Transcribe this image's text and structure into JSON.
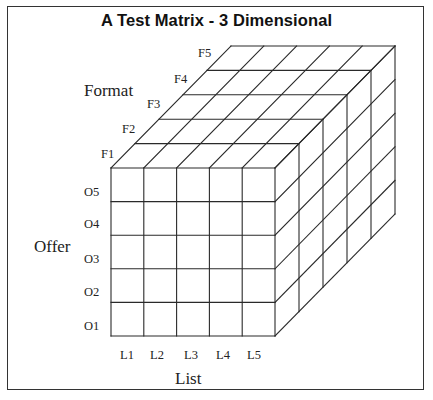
{
  "title": "A Test Matrix - 3 Dimensional",
  "colors": {
    "line": "#2a2a2a",
    "frame": "#333333",
    "background": "#ffffff"
  },
  "axes": {
    "format": {
      "label": "Format",
      "ticks": [
        "F1",
        "F2",
        "F3",
        "F4",
        "F5"
      ]
    },
    "offer": {
      "label": "Offer",
      "ticks": [
        "O1",
        "O2",
        "O3",
        "O4",
        "O5"
      ]
    },
    "list": {
      "label": "List",
      "ticks": [
        "L1",
        "L2",
        "L3",
        "L4",
        "L5"
      ]
    }
  },
  "grid": {
    "columns": 5,
    "rows": 5,
    "depth": 5
  }
}
